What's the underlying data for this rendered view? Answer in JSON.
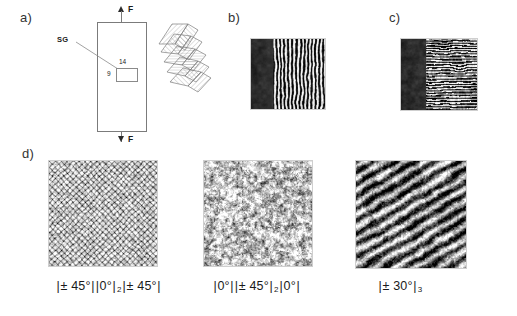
{
  "figure": {
    "panels": {
      "a": "a)",
      "b": "b)",
      "c": "c)",
      "d": "d)"
    }
  },
  "panel_a": {
    "name": "tensile-specimen-schematic",
    "force_label_top": "F",
    "force_label_bottom": "F",
    "strain_gauge_label": "SG",
    "gauge_width_label": "14",
    "gauge_height_label": "9",
    "stack_label": "laminate-stacking-sequence"
  },
  "panel_b": {
    "name": "micrograph-vertical-fringes",
    "description": "dark edge band with vertical fringe pattern"
  },
  "panel_c": {
    "name": "micrograph-horizontal-striations",
    "description": "dark edge band with fine horizontal striations"
  },
  "panel_d": {
    "images": [
      {
        "name": "micrograph-cross-hatch-45",
        "caption_parts": [
          "|",
          "± 45°",
          "|",
          "|",
          "0°",
          "|",
          "2",
          "|",
          "± 45°",
          "|"
        ],
        "caption_text": "|± 45°||0°|2|± 45°|"
      },
      {
        "name": "micrograph-mottled-0",
        "caption_parts": [
          "|",
          "0°",
          "|",
          "|",
          "± 45°",
          "|",
          "2",
          "|",
          "0°",
          "|"
        ],
        "caption_text": "|0°||± 45°|2|0°|"
      },
      {
        "name": "micrograph-diagonal-30",
        "caption_parts": [
          "|",
          "± 30°",
          "|",
          "3"
        ],
        "caption_text": "|± 30°|3"
      }
    ]
  },
  "colors": {
    "background": "#ffffff",
    "ink": "#1a1a1a",
    "line": "#7b7b7b",
    "frame": "#cfcfcf"
  }
}
